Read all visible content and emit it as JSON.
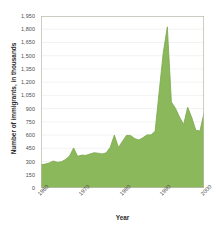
{
  "chart_data": {
    "type": "area",
    "title": "",
    "xlabel": "Year",
    "ylabel": "Number of immigrants, in thousands",
    "xlim": [
      1960,
      2000
    ],
    "ylim": [
      0,
      1950
    ],
    "grid": true,
    "legend": false,
    "series_color": "#8cb85c",
    "series_line_color": "#7ba84e",
    "grid_color": "#ededed",
    "axis_color": "#b9b9a8",
    "ytick_labels": [
      "1,950",
      "1,800",
      "1,650",
      "1,500",
      "1,350",
      "1,200",
      "1,050",
      "900",
      "750",
      "600",
      "450",
      "300",
      "150",
      "0"
    ],
    "ytick_values": [
      1950,
      1800,
      1650,
      1500,
      1350,
      1200,
      1050,
      900,
      750,
      600,
      450,
      300,
      150,
      0
    ],
    "xtick_labels": [
      "1960",
      "1970",
      "1980",
      "1990",
      "2000"
    ],
    "xtick_values": [
      1960,
      1970,
      1980,
      1990,
      2000
    ],
    "series": [
      {
        "name": "Immigrants",
        "x": [
          1960,
          1961,
          1962,
          1963,
          1964,
          1965,
          1966,
          1967,
          1968,
          1969,
          1970,
          1971,
          1972,
          1973,
          1974,
          1975,
          1976,
          1977,
          1978,
          1979,
          1980,
          1981,
          1982,
          1983,
          1984,
          1985,
          1986,
          1987,
          1988,
          1989,
          1990,
          1991,
          1992,
          1993,
          1994,
          1995,
          1996,
          1997,
          1998,
          1999,
          2000
        ],
        "values": [
          265,
          271,
          284,
          306,
          292,
          297,
          323,
          362,
          454,
          359,
          373,
          370,
          385,
          400,
          395,
          386,
          399,
          462,
          601,
          460,
          531,
          597,
          594,
          560,
          544,
          570,
          602,
          602,
          643,
          1091,
          1536,
          1827,
          974,
          904,
          804,
          720,
          916,
          798,
          655,
          647,
          850
        ]
      }
    ],
    "annotations": []
  }
}
